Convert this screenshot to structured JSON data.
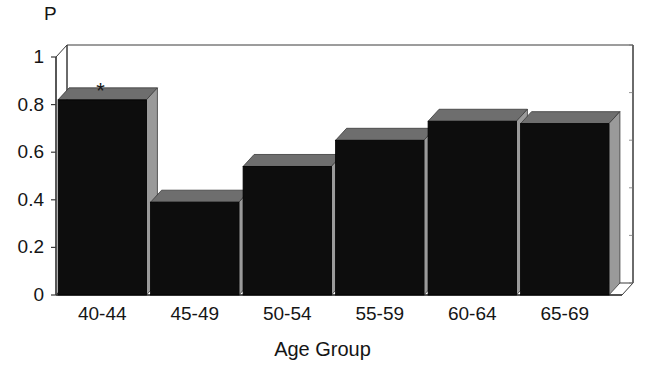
{
  "chart_data": {
    "type": "bar",
    "title": "",
    "subtitle": "",
    "xlabel": "Age Group",
    "ylabel": "P",
    "categories": [
      "40-44",
      "45-49",
      "50-54",
      "55-59",
      "60-64",
      "65-69"
    ],
    "values": [
      0.82,
      0.39,
      0.54,
      0.65,
      0.73,
      0.72
    ],
    "ylim": [
      0,
      1
    ],
    "xlim_note": "categorical",
    "ytick_labels": [
      "0",
      "0.2",
      "0.4",
      "0.6",
      "0.8",
      "1"
    ],
    "ytick_values": [
      0,
      0.2,
      0.4,
      0.6,
      0.8,
      1
    ],
    "grid": "horizontal dotted gridlines at 0.4, 0.6 and 0.8",
    "gridline_values": [
      0.4,
      0.6,
      0.8
    ],
    "legend": "none",
    "legend_position": "none",
    "style": "3d bar chart, black bar faces with light gray top and side faces, white background",
    "annotations": [
      {
        "text": "*",
        "name": "significance-asterisk",
        "category": "40-44",
        "value": 0.87,
        "meaning": "marker above first bar"
      }
    ],
    "bar_face_color": "#0d0d0d",
    "bar_side_color": "#9a9a9a",
    "bar_top_color": "#6e6e6e",
    "axis_color": "#3a3a3a",
    "background_color": "#ffffff"
  },
  "axes": {
    "y_title": "P",
    "x_title": "Age Group"
  }
}
